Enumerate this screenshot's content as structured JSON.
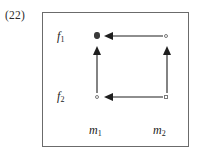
{
  "figure": {
    "number_label": "(22)",
    "type": "commutative-diagram",
    "frame": {
      "border_color": "#6b6b6b",
      "background_color": "#ffffff"
    },
    "ink_color": "#1e1e1e",
    "row_labels": [
      {
        "id": "f1",
        "base": "f",
        "subscript": "1",
        "display": "f₁"
      },
      {
        "id": "f2",
        "base": "f",
        "subscript": "2",
        "display": "f₂"
      }
    ],
    "column_labels": [
      {
        "id": "m1",
        "base": "m",
        "subscript": "1",
        "display": "m₁"
      },
      {
        "id": "m2",
        "base": "m",
        "subscript": "2",
        "display": "m₂"
      }
    ],
    "nodes": [
      {
        "id": "f1-m1",
        "row": "f1",
        "column": "m1",
        "marker": "filled-dot"
      },
      {
        "id": "f1-m2",
        "row": "f1",
        "column": "m2",
        "marker": "open-circle"
      },
      {
        "id": "f2-m1",
        "row": "f2",
        "column": "m1",
        "marker": "open-circle"
      },
      {
        "id": "f2-m2",
        "row": "f2",
        "column": "m2",
        "marker": "open-square"
      }
    ],
    "arrows": [
      {
        "id": "top-horizontal",
        "from": "f1-m2",
        "to": "f1-m1",
        "direction": "left"
      },
      {
        "id": "bottom-horizontal",
        "from": "f2-m2",
        "to": "f2-m1",
        "direction": "left"
      },
      {
        "id": "left-vertical",
        "from": "f2-m1",
        "to": "f1-m1",
        "direction": "up"
      },
      {
        "id": "right-vertical",
        "from": "f2-m2",
        "to": "f1-m2",
        "direction": "up"
      }
    ]
  }
}
